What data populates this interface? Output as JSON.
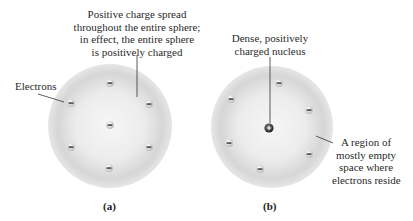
{
  "figure": {
    "panel_a": {
      "caption": "(a)",
      "top_label": [
        "Positive charge spread",
        "throughout the entire sphere;",
        "in effect, the entire sphere",
        "is positively charged"
      ],
      "side_label": "Electrons",
      "electron_symbol": "−",
      "electron_count": 7
    },
    "panel_b": {
      "caption": "(b)",
      "top_label": [
        "Dense, positively",
        "charged nucleus"
      ],
      "side_label": [
        "A region of",
        "mostly empty",
        "space where",
        "electrons reside"
      ],
      "nucleus_symbol": "+",
      "electron_symbol": "−",
      "electron_count": 6
    }
  },
  "colors": {
    "sphere_light": "#f4f4f4",
    "sphere_dark": "#c8c8c8",
    "electron_fill": "#e0e0e0",
    "nucleus_fill": "#3a3a3a",
    "line": "#333333"
  }
}
